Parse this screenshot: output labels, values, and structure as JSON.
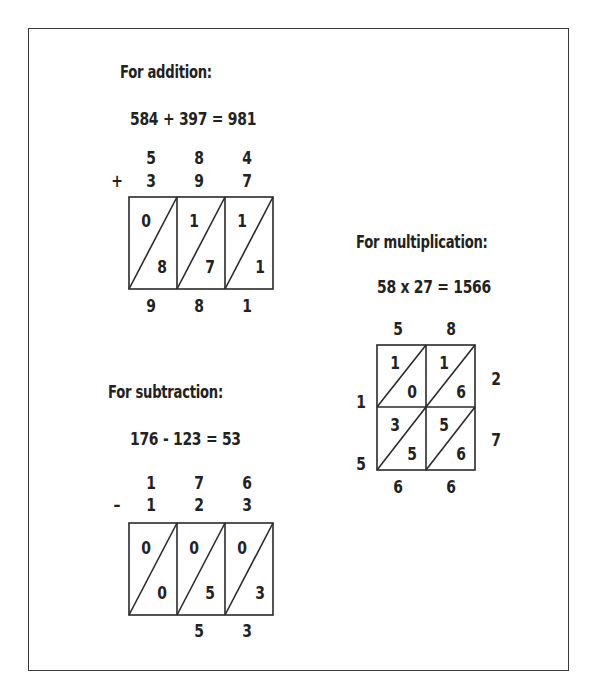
{
  "addition": {
    "heading": "For addition:",
    "equation": "584 + 397 = 981",
    "operator": "+",
    "top_digits": [
      "5",
      "8",
      "4"
    ],
    "bottom_digits": [
      "3",
      "9",
      "7"
    ],
    "cells": [
      {
        "upper": "0",
        "lower": "8"
      },
      {
        "upper": "1",
        "lower": "7"
      },
      {
        "upper": "1",
        "lower": "1"
      }
    ],
    "result_digits": [
      "9",
      "8",
      "1"
    ]
  },
  "subtraction": {
    "heading": "For subtraction:",
    "equation": "176 - 123 = 53",
    "operator": "–",
    "top_digits": [
      "1",
      "7",
      "6"
    ],
    "bottom_digits": [
      "1",
      "2",
      "3"
    ],
    "cells": [
      {
        "upper": "0",
        "lower": "0"
      },
      {
        "upper": "0",
        "lower": "5"
      },
      {
        "upper": "0",
        "lower": "3"
      }
    ],
    "result_digits": [
      "",
      "5",
      "3"
    ]
  },
  "multiplication": {
    "heading": "For multiplication:",
    "equation": "58 x 27 = 1566",
    "top_digits": [
      "5",
      "8"
    ],
    "right_digits": [
      "2",
      "7"
    ],
    "left_digits": [
      "1",
      "5"
    ],
    "cells": [
      [
        {
          "upper": "1",
          "lower": "0"
        },
        {
          "upper": "1",
          "lower": "6"
        }
      ],
      [
        {
          "upper": "3",
          "lower": "5"
        },
        {
          "upper": "5",
          "lower": "6"
        }
      ]
    ],
    "bottom_digits": [
      "6",
      "6"
    ]
  }
}
